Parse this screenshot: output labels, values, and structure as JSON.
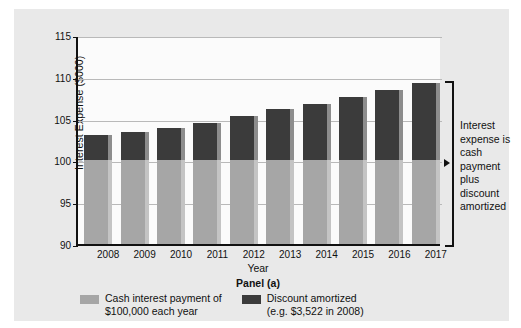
{
  "chart_data": {
    "type": "bar",
    "stacked": true,
    "title": "",
    "subtitle": "",
    "panel_caption": "Panel (a)",
    "xlabel": "Year",
    "ylabel": "Interest Expense ($000)",
    "ylim": [
      90,
      115
    ],
    "yticks": [
      115,
      110,
      105,
      100,
      95,
      90
    ],
    "grid": true,
    "legend_position": "bottom-left",
    "categories": [
      "2008",
      "2009",
      "2010",
      "2011",
      "2012",
      "2013",
      "2014",
      "2015",
      "2016",
      "2017"
    ],
    "series": [
      {
        "name": "Cash interest payment of $100,000 each year",
        "color": "#a6a6a6",
        "values": [
          100,
          100,
          100,
          100,
          100,
          100,
          100,
          100,
          100,
          100
        ]
      },
      {
        "name": "Discount amortized (e.g. $3,522 in 2008)",
        "color": "#3b3b3b",
        "values": [
          3.1,
          3.4,
          3.9,
          4.5,
          5.3,
          6.1,
          6.8,
          7.6,
          8.4,
          9.3
        ]
      }
    ],
    "totals": [
      103.1,
      103.4,
      103.9,
      104.5,
      105.3,
      106.1,
      106.8,
      107.6,
      108.4,
      109.3
    ],
    "annotations": [
      {
        "name": "bracket-note",
        "text": "Interest expense is cash payment plus discount amortized"
      }
    ]
  },
  "axes": {
    "y_title": "Interest Expense ($000)",
    "y_labels": [
      "115",
      "110",
      "105",
      "100",
      "95",
      "90"
    ],
    "x_title": "Year",
    "x_labels": [
      "2008",
      "2009",
      "2010",
      "2011",
      "2012",
      "2013",
      "2014",
      "2015",
      "2016",
      "2017"
    ]
  },
  "caption": {
    "panel": "Panel (a)"
  },
  "legend": {
    "items": [
      {
        "label": "Cash interest payment of\n$100,000 each year",
        "color": "#a6a6a6"
      },
      {
        "label": "Discount amortized\n(e.g. $3,522 in 2008)",
        "color": "#3b3b3b"
      }
    ]
  },
  "side_note": {
    "text": "Interest expense is cash payment plus discount amortized"
  }
}
